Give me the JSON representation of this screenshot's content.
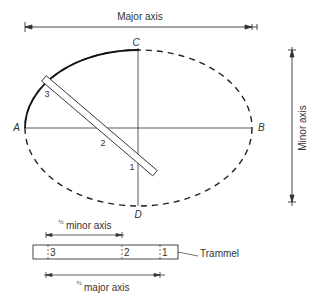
{
  "labels": {
    "major_axis": "Major axis",
    "minor_axis": "Minor axis",
    "half_minor_axis": "minor axis",
    "half_major_axis": "major axis",
    "half_fraction": "½",
    "trammel": "Trammel"
  },
  "points": {
    "A": "A",
    "B": "B",
    "C": "C",
    "D": "D"
  },
  "trammel_marks": {
    "m1": "1",
    "m2": "2",
    "m3": "3"
  },
  "colors": {
    "line": "#333333",
    "background": "#ffffff"
  }
}
